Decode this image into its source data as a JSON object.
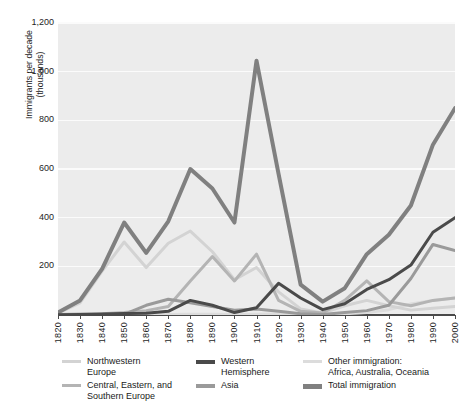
{
  "figure": {
    "title_sliver": "Immigration to the United States by region of origin"
  },
  "axes": {
    "ylabel_line1": "Immigrants per decade",
    "ylabel_line2": "(thousands)",
    "yticks": [
      "0",
      "200",
      "400",
      "600",
      "800",
      "1,000",
      "1,200"
    ],
    "xticks": [
      "1820",
      "1830",
      "1840",
      "1850",
      "1860",
      "1870",
      "1880",
      "1890",
      "1900",
      "1910",
      "1920",
      "1930",
      "1940",
      "1950",
      "1960",
      "1970",
      "1980",
      "1990",
      "2000"
    ]
  },
  "legend": {
    "items": [
      {
        "label": "Northwestern\nEurope",
        "color": "#d3d3d3",
        "thickness": 3
      },
      {
        "label": "Central, Eastern, and\nSouthern Europe",
        "color": "#b4b4b4",
        "thickness": 3
      },
      {
        "label": "Western\nHemisphere",
        "color": "#4a4a4a",
        "thickness": 3.5
      },
      {
        "label": "Asia",
        "color": "#9a9a9a",
        "thickness": 3.5
      },
      {
        "label": "Other immigration:\nAfrica, Australia, Oceania",
        "color": "#dcdcdc",
        "thickness": 3
      },
      {
        "label": "Total immigration",
        "color": "#808080",
        "thickness": 5
      }
    ]
  },
  "chart_data": {
    "type": "line",
    "title": "Immigration to the United States by region of origin",
    "xlabel": "",
    "ylabel": "Immigrants per decade (thousands)",
    "xlim": [
      1820,
      2000
    ],
    "ylim": [
      0,
      1200
    ],
    "grid": true,
    "legend_position": "below",
    "x": [
      1820,
      1830,
      1840,
      1850,
      1860,
      1870,
      1880,
      1890,
      1900,
      1910,
      1920,
      1930,
      1940,
      1950,
      1960,
      1970,
      1980,
      1990,
      2000
    ],
    "series": [
      {
        "name": "Northwestern Europe",
        "color": "#d3d3d3",
        "values": [
          8,
          50,
          180,
          300,
          195,
          295,
          345,
          260,
          145,
          195,
          95,
          25,
          8,
          38,
          60,
          38,
          20,
          28,
          35
        ]
      },
      {
        "name": "Central, Eastern, and Southern Europe",
        "color": "#b4b4b4",
        "values": [
          2,
          4,
          5,
          10,
          18,
          35,
          140,
          240,
          140,
          250,
          60,
          15,
          8,
          60,
          140,
          55,
          38,
          60,
          70
        ]
      },
      {
        "name": "Western Hemisphere",
        "color": "#4a4a4a",
        "values": [
          1,
          2,
          4,
          6,
          7,
          15,
          60,
          40,
          10,
          30,
          130,
          70,
          22,
          46,
          105,
          145,
          205,
          340,
          400
        ]
      },
      {
        "name": "Asia",
        "color": "#9a9a9a",
        "values": [
          0,
          0,
          1,
          3,
          40,
          65,
          50,
          35,
          20,
          25,
          15,
          5,
          2,
          10,
          18,
          40,
          150,
          290,
          265
        ]
      },
      {
        "name": "Other immigration: Africa, Australia, Oceania",
        "color": "#dcdcdc",
        "values": [
          0,
          0,
          0,
          0,
          1,
          2,
          3,
          3,
          2,
          3,
          4,
          2,
          1,
          5,
          10,
          22,
          45,
          60,
          70
        ]
      },
      {
        "name": "Total immigration",
        "color": "#808080",
        "values": [
          10,
          60,
          190,
          380,
          255,
          385,
          600,
          520,
          380,
          1045,
          580,
          125,
          55,
          110,
          250,
          330,
          450,
          700,
          850
        ]
      }
    ]
  }
}
